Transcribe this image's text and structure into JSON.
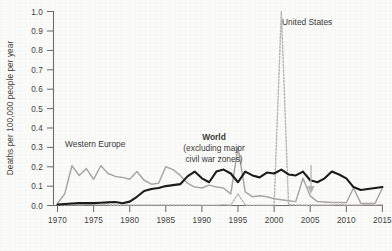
{
  "chart_data": {
    "type": "line",
    "title": "",
    "xlabel": "",
    "ylabel": "Deaths per 100,000 people per year",
    "xlim": [
      1970,
      2015
    ],
    "ylim": [
      0.0,
      1.0
    ],
    "grid": false,
    "legend_position": "inline-annotations",
    "x_ticks": [
      "1970",
      "1975",
      "1980",
      "1985",
      "1990",
      "1995",
      "2000",
      "2005",
      "2010",
      "2015"
    ],
    "x_tick_values": [
      1970,
      1975,
      1980,
      1985,
      1990,
      1995,
      2000,
      2005,
      2010,
      2015
    ],
    "y_ticks": [
      "0.0",
      "0.1",
      "0.2",
      "0.3",
      "0.4",
      "0.5",
      "0.6",
      "0.7",
      "0.8",
      "0.9",
      "1.0"
    ],
    "y_tick_values": [
      0.0,
      0.1,
      0.2,
      0.3,
      0.4,
      0.5,
      0.6,
      0.7,
      0.8,
      0.9,
      1.0
    ],
    "x": [
      1970,
      1971,
      1972,
      1973,
      1974,
      1975,
      1976,
      1977,
      1978,
      1979,
      1980,
      1981,
      1982,
      1983,
      1984,
      1985,
      1986,
      1987,
      1988,
      1989,
      1990,
      1991,
      1992,
      1993,
      1994,
      1995,
      1996,
      1997,
      1998,
      1999,
      2000,
      2001,
      2002,
      2003,
      2004,
      2005,
      2006,
      2007,
      2008,
      2009,
      2010,
      2011,
      2012,
      2013,
      2014,
      2015
    ],
    "series": [
      {
        "name": "World",
        "label": "World",
        "sublabel": "(excluding major civil war zones)",
        "color": "#1b1b1a",
        "style": "solid",
        "values": [
          0.005,
          0.008,
          0.01,
          0.012,
          0.013,
          0.012,
          0.014,
          0.016,
          0.018,
          0.012,
          0.02,
          0.045,
          0.075,
          0.085,
          0.09,
          0.1,
          0.105,
          0.11,
          0.15,
          0.175,
          0.14,
          0.12,
          0.175,
          0.185,
          0.165,
          0.12,
          0.175,
          0.155,
          0.145,
          0.17,
          0.165,
          0.185,
          0.16,
          0.155,
          0.175,
          0.13,
          0.12,
          0.14,
          0.175,
          0.16,
          0.14,
          0.095,
          0.08,
          0.085,
          0.09,
          0.095
        ]
      },
      {
        "name": "Western Europe",
        "label": "Western Europe",
        "color": "#a9a7a1",
        "style": "solid",
        "values": [
          0.01,
          0.06,
          0.205,
          0.155,
          0.19,
          0.135,
          0.205,
          0.165,
          0.15,
          0.145,
          0.135,
          0.175,
          0.13,
          0.11,
          0.115,
          0.2,
          0.185,
          0.155,
          0.115,
          0.095,
          0.09,
          0.105,
          0.095,
          0.09,
          0.06,
          0.3,
          0.07,
          0.045,
          0.05,
          0.045,
          0.035,
          0.03,
          0.025,
          0.02,
          0.14,
          0.05,
          0.02,
          0.018,
          0.016,
          0.015,
          0.014,
          0.09,
          0.012,
          0.01,
          0.012,
          0.09
        ]
      },
      {
        "name": "United States",
        "label": "United States",
        "color": "#b9b7b1",
        "style": "dotted",
        "values": [
          0.004,
          0.004,
          0.004,
          0.003,
          0.005,
          0.004,
          0.004,
          0.003,
          0.003,
          0.003,
          0.003,
          0.003,
          0.003,
          0.003,
          0.003,
          0.003,
          0.003,
          0.003,
          0.003,
          0.003,
          0.002,
          0.002,
          0.002,
          0.004,
          0.002,
          0.06,
          0.002,
          0.002,
          0.002,
          0.002,
          0.002,
          1.0,
          0.004,
          0.003,
          0.003,
          0.003,
          0.003,
          0.003,
          0.003,
          0.004,
          0.003,
          0.003,
          0.003,
          0.004,
          0.003,
          0.004
        ]
      }
    ],
    "annotations": [
      {
        "name": "us-decline-arrow",
        "type": "arrow",
        "direction": "down",
        "x": 2009,
        "color": "#b6b4ae"
      }
    ]
  }
}
